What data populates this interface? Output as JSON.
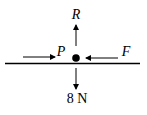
{
  "diagram": {
    "type": "free-body-diagram",
    "colors": {
      "ink": "#000000",
      "background": "#ffffff"
    },
    "surface": {
      "label": ""
    },
    "object": {
      "shape": "dot"
    },
    "forces": [
      {
        "id": "R",
        "label": "R",
        "direction": "up",
        "italic": true
      },
      {
        "id": "P",
        "label": "P",
        "direction": "right",
        "italic": true
      },
      {
        "id": "F",
        "label": "F",
        "direction": "left",
        "italic": true
      },
      {
        "id": "W",
        "label": "8 N",
        "direction": "down",
        "italic": false
      }
    ]
  }
}
